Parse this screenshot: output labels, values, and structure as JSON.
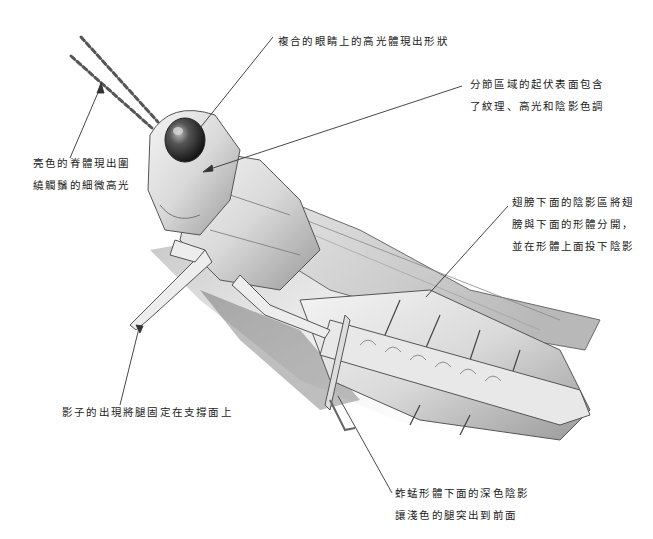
{
  "illustration": {
    "subject": "grasshopper pencil drawing",
    "palette": {
      "ink": "#1a1a1a",
      "shade_dark": "#3a3a3a",
      "shade_mid": "#8a8a8a",
      "shade_light": "#cfcfcf",
      "paper": "#ffffff"
    }
  },
  "annotations": [
    {
      "id": "eye",
      "lines": [
        "複合的眼睛上的高光體現出形狀"
      ],
      "x": 278,
      "y": 30,
      "leader": {
        "from": [
          273,
          37
        ],
        "to": [
          200,
          128
        ]
      }
    },
    {
      "id": "segments",
      "lines": [
        "分節區域的起伏表面包含",
        "了紋理、高光和陰影色調"
      ],
      "x": 470,
      "y": 73,
      "leader": {
        "from": [
          462,
          86
        ],
        "to": [
          203,
          171
        ]
      }
    },
    {
      "id": "antennae",
      "lines": [
        "亮色的脊體現出圍",
        "繞觸鬚的細微高光"
      ],
      "x": 33,
      "y": 154,
      "leader": {
        "from": [
          70,
          158
        ],
        "to": [
          101,
          83
        ]
      }
    },
    {
      "id": "wing-shadow",
      "lines": [
        "翅膀下面的陰影區將翅",
        "膀與下面的形體分開，",
        "並在形體上面投下陰影"
      ],
      "x": 512,
      "y": 193,
      "leader": {
        "from": [
          508,
          206
        ],
        "to": [
          426,
          297
        ]
      }
    },
    {
      "id": "support-shadow",
      "lines": [
        "影子的出現將腿固定在支撐面上"
      ],
      "x": 62,
      "y": 402,
      "leader": {
        "from": [
          120,
          405
        ],
        "to": [
          139,
          328
        ]
      }
    },
    {
      "id": "leg-contrast",
      "lines": [
        "蚱蜢形體下面的深色陰影",
        "讓淺色的腿突出到前面"
      ],
      "x": 395,
      "y": 483,
      "leader": {
        "from": [
          392,
          493
        ],
        "to": [
          338,
          396
        ]
      }
    }
  ]
}
